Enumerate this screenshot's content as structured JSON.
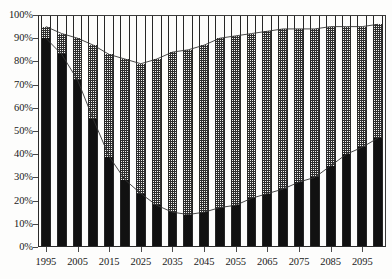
{
  "chart_data": {
    "type": "bar",
    "stacked": true,
    "stack_mode": "percent",
    "title": "",
    "subtitle": "",
    "xlabel": "",
    "ylabel": "",
    "ylim": [
      0,
      100
    ],
    "y_tick_labels": [
      "0%",
      "10%",
      "20%",
      "30%",
      "40%",
      "50%",
      "60%",
      "70%",
      "80%",
      "90%",
      "100%"
    ],
    "y_tick_values": [
      0,
      10,
      20,
      30,
      40,
      50,
      60,
      70,
      80,
      90,
      100
    ],
    "grid": false,
    "legend": "none",
    "x": [
      1995,
      2000,
      2005,
      2010,
      2015,
      2020,
      2025,
      2030,
      2035,
      2040,
      2045,
      2050,
      2055,
      2060,
      2065,
      2070,
      2075,
      2080,
      2085,
      2090,
      2095,
      2100
    ],
    "categories": [
      "1995",
      "2000",
      "2005",
      "2010",
      "2015",
      "2020",
      "2025",
      "2030",
      "2035",
      "2040",
      "2045",
      "2050",
      "2055",
      "2060",
      "2065",
      "2070",
      "2075",
      "2080",
      "2085",
      "2090",
      "2095",
      "2100"
    ],
    "x_tick_labels": [
      "1995",
      "2005",
      "2015",
      "2025",
      "2035",
      "2045",
      "2055",
      "2065",
      "2075",
      "2085",
      "2095"
    ],
    "x_tick_values": [
      1995,
      2005,
      2015,
      2025,
      2035,
      2045,
      2055,
      2065,
      2075,
      2085,
      2095
    ],
    "series": [
      {
        "name": "bottom-series",
        "pattern": "solid-black",
        "color": "#111111",
        "values": [
          90,
          83,
          72,
          55,
          39,
          29,
          23,
          18,
          15,
          14,
          15,
          17,
          18,
          21,
          23,
          25,
          28,
          30,
          35,
          40,
          43,
          47
        ]
      },
      {
        "name": "middle-series",
        "pattern": "checkered-gray",
        "color": "#808080",
        "values": [
          5,
          9,
          18,
          32,
          44,
          52,
          56,
          63,
          69,
          71,
          72,
          73,
          73,
          71,
          70,
          69,
          66,
          64,
          60,
          55,
          52,
          49
        ]
      },
      {
        "name": "top-series",
        "pattern": "white-blank",
        "color": "#fcfcfb",
        "values": [
          5,
          8,
          10,
          13,
          17,
          19,
          21,
          19,
          16,
          15,
          13,
          10,
          9,
          8,
          7,
          6,
          6,
          6,
          5,
          5,
          5,
          4
        ]
      }
    ],
    "cumulative_lower_boundary": [
      90,
      83,
      72,
      55,
      39,
      29,
      23,
      18,
      15,
      14,
      15,
      17,
      18,
      21,
      23,
      25,
      28,
      30,
      35,
      40,
      43,
      47
    ],
    "cumulative_upper_boundary": [
      95,
      92,
      90,
      87,
      83,
      81,
      79,
      81,
      84,
      85,
      87,
      90,
      91,
      92,
      93,
      94,
      94,
      94,
      95,
      95,
      95,
      96
    ]
  }
}
